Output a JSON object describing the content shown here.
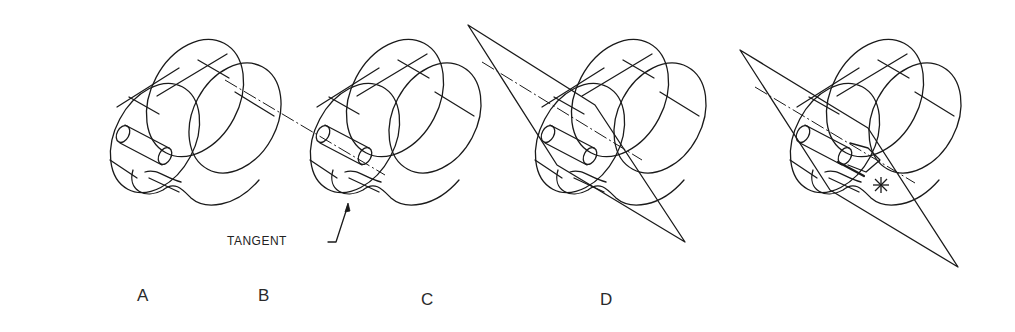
{
  "figure": {
    "type": "isometric construction sequence",
    "line_color": "#1a1a1a",
    "background": "#ffffff"
  },
  "panels": [
    {
      "id": "A",
      "label": "A",
      "description": "Isometric solid with two intersecting elliptical cylinders and a bore"
    },
    {
      "id": "B",
      "label": "B",
      "description": "Same solid with dash-dot axis line added and tangent point annotated"
    },
    {
      "id": "C",
      "label": "C",
      "description": "Cutting plane (triangle) passed through the axis"
    },
    {
      "id": "D",
      "label": "D",
      "description": "Intersection of plane with surface, tangent point marked with star"
    }
  ],
  "annotations": {
    "tangent": "TANGENT"
  }
}
